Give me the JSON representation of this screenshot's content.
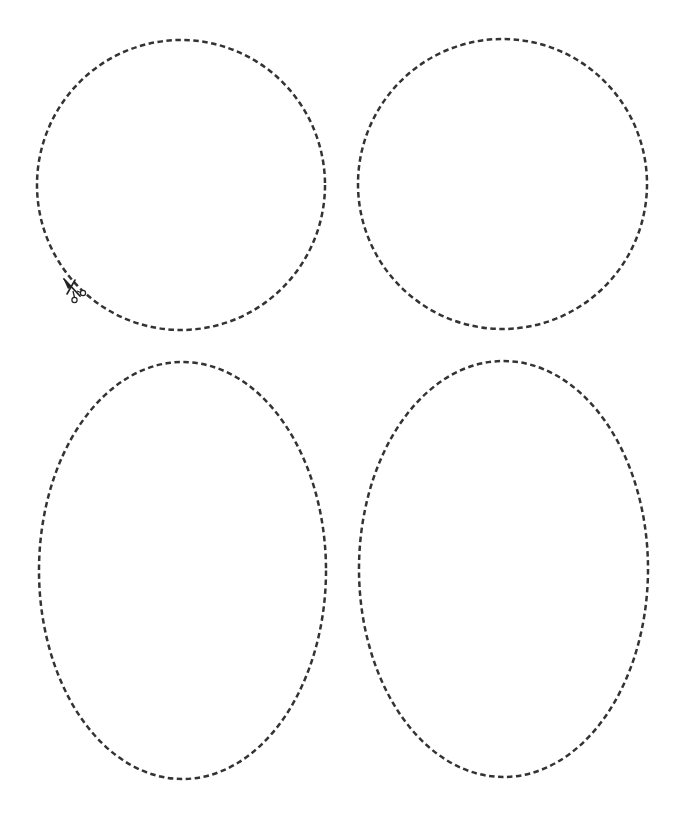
{
  "page": {
    "width": 691,
    "height": 823,
    "background": "#ffffff"
  },
  "style": {
    "stroke_color": "#333333",
    "dash_pattern": "5.5 3.5",
    "stroke_width": 2.5
  },
  "shapes": [
    {
      "id": "circle-top-left",
      "type": "circle",
      "cx": 181,
      "cy": 185,
      "rx": 144,
      "ry": 145
    },
    {
      "id": "circle-top-right",
      "type": "circle",
      "cx": 502.5,
      "cy": 184,
      "rx": 144.5,
      "ry": 145
    },
    {
      "id": "oval-bottom-left",
      "type": "oval",
      "cx": 182.5,
      "cy": 570.5,
      "rx": 143.5,
      "ry": 208.5
    },
    {
      "id": "oval-bottom-right",
      "type": "oval",
      "cx": 503.5,
      "cy": 569,
      "rx": 144.5,
      "ry": 208
    }
  ],
  "icons": {
    "scissors": {
      "name": "scissors-icon",
      "x": 62,
      "y": 276
    }
  }
}
